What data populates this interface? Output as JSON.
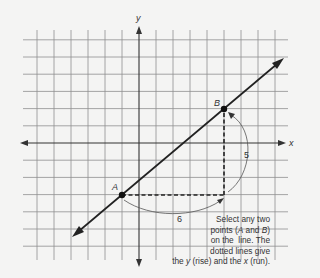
{
  "diagram": {
    "type": "coordinate-plane-slope",
    "axes": {
      "x_label": "x",
      "y_label": "y"
    },
    "grid": {
      "columns_left_of_y_axis": 6,
      "columns_right_of_y_axis": 8,
      "rows_above_x_axis": 6,
      "rows_below_x_axis": 6
    },
    "points": [
      {
        "label": "A",
        "grid_x": -1,
        "grid_y": -3
      },
      {
        "label": "B",
        "grid_x": 5,
        "grid_y": 2
      }
    ],
    "rise_label": "5",
    "run_label": "6",
    "caption_lines": [
      {
        "parts": [
          "Select any two"
        ]
      },
      {
        "parts": [
          "points (",
          "A",
          " and ",
          "B",
          ")"
        ]
      },
      {
        "parts": [
          "on the  line. The"
        ]
      },
      {
        "parts": [
          "dotted lines give"
        ]
      },
      {
        "parts": [
          "the ",
          "y",
          " (rise) and the ",
          "x",
          " (run)."
        ]
      }
    ],
    "colors": {
      "grid": "#8a8a8a",
      "axis": "#333333",
      "line": "#222222",
      "background": "#f4f4f3",
      "text": "#333333"
    }
  }
}
